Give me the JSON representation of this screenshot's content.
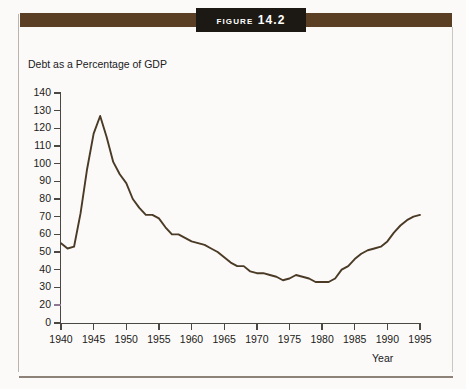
{
  "figure": {
    "title": "Figure 14.2",
    "band_color": "#5b3f25",
    "plaque_color": "#1c1914"
  },
  "chart_data": {
    "type": "line",
    "title": "Figure 14.2",
    "ylabel": "Debt as a Percentage of GDP",
    "xlabel": "Year",
    "xlim": [
      1940,
      1995
    ],
    "ylim": [
      0,
      140
    ],
    "grid": false,
    "legend": null,
    "line_color": "#4a3a26",
    "y_ticks": [
      140,
      130,
      120,
      110,
      100,
      90,
      80,
      70,
      60,
      50,
      40,
      30,
      20,
      0
    ],
    "x_ticks": [
      1940,
      1945,
      1950,
      1955,
      1960,
      1965,
      1970,
      1975,
      1980,
      1985,
      1990,
      1995
    ],
    "series": [
      {
        "name": "Debt as a Percentage of GDP",
        "x": [
          1940,
          1941,
          1942,
          1943,
          1944,
          1945,
          1946,
          1947,
          1948,
          1949,
          1950,
          1951,
          1952,
          1953,
          1954,
          1955,
          1956,
          1957,
          1958,
          1959,
          1960,
          1961,
          1962,
          1963,
          1964,
          1965,
          1966,
          1967,
          1968,
          1969,
          1970,
          1971,
          1972,
          1973,
          1974,
          1975,
          1976,
          1977,
          1978,
          1979,
          1980,
          1981,
          1982,
          1983,
          1984,
          1985,
          1986,
          1987,
          1988,
          1989,
          1990,
          1991,
          1992,
          1993,
          1994,
          1995
        ],
        "values": [
          55,
          52,
          53,
          72,
          97,
          117,
          127,
          115,
          101,
          94,
          89,
          80,
          75,
          71,
          71,
          69,
          64,
          60,
          60,
          58,
          56,
          55,
          54,
          52,
          50,
          47,
          44,
          42,
          42,
          39,
          38,
          38,
          37,
          36,
          34,
          35,
          37,
          36,
          35,
          33,
          33,
          33,
          35,
          40,
          42,
          46,
          49,
          51,
          52,
          53,
          56,
          61,
          65,
          68,
          70,
          71
        ]
      }
    ],
    "annotations": [
      {
        "text": "Peak of roughly 127 percent of GDP just after World War II (1946)"
      },
      {
        "text": "Trough of roughly 33 percent of GDP around 1979-1981"
      },
      {
        "text": "Rises back to roughly 70 percent of GDP by 1995"
      }
    ]
  },
  "axes": {
    "y_caption": "Debt as a Percentage of GDP",
    "x_caption": "Year"
  }
}
